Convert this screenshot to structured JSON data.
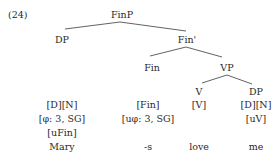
{
  "example_number": "(24)",
  "tree": {
    "root": "FinP",
    "spec": "DP",
    "bar": "Fin'",
    "head": "Fin",
    "complement": "VP",
    "v_head": "V",
    "v_complement": "DP"
  },
  "columns": {
    "mary": {
      "features": [
        "[D][N]",
        "[φ: 3, SG]",
        "[uFin]"
      ],
      "word": "Mary"
    },
    "s": {
      "features": [
        "[Fin]",
        "[uφ: 3, SG]"
      ],
      "word": "-s"
    },
    "love": {
      "features": [
        "[V]"
      ],
      "word": "love"
    },
    "me": {
      "features": [
        "[D][N]",
        "[uV]"
      ],
      "word": "me"
    }
  },
  "colors": {
    "text": "#2a2a2a",
    "lines": "#3a3a3a"
  }
}
